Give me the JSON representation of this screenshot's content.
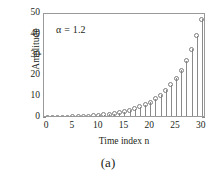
{
  "caption": "(a)",
  "annotation": "α = 1.2",
  "chart_data": {
    "type": "line",
    "subtype": "stem",
    "title": "",
    "subtitle": "",
    "xlabel": "Time index n",
    "ylabel": "Amplitude",
    "xlim": [
      -0.6,
      30.8
    ],
    "ylim": [
      0,
      50
    ],
    "xticks": [
      0,
      5,
      10,
      15,
      20,
      25,
      30
    ],
    "xticklabels": [
      "0",
      "5",
      "10",
      "15",
      "20",
      "25",
      "30"
    ],
    "yticks": [
      0,
      10,
      20,
      30,
      40,
      50
    ],
    "yticklabels": [
      "0",
      "10",
      "20",
      "30",
      "40",
      "50"
    ],
    "grid": false,
    "legend": null,
    "annotations": [
      {
        "text": "α = 1.2",
        "x": 3.0,
        "y": 41.0
      }
    ],
    "marker": "open-circle",
    "line_color": "#8a8a8a",
    "marker_color": "#7d7d7d",
    "series": [
      {
        "name": "0.2 · (1.2)^n",
        "x": [
          0,
          1,
          2,
          3,
          4,
          5,
          6,
          7,
          8,
          9,
          10,
          11,
          12,
          13,
          14,
          15,
          16,
          17,
          18,
          19,
          20,
          21,
          22,
          23,
          24,
          25,
          26,
          27,
          28,
          29,
          30
        ],
        "values": [
          0.2,
          0.24,
          0.29,
          0.35,
          0.41,
          0.5,
          0.6,
          0.72,
          0.86,
          1.03,
          1.24,
          1.49,
          1.78,
          2.14,
          2.57,
          3.08,
          3.7,
          4.44,
          5.33,
          6.39,
          7.67,
          9.2,
          11.04,
          13.25,
          15.9,
          19.08,
          22.89,
          27.47,
          32.97,
          39.56,
          47.47
        ]
      }
    ]
  }
}
